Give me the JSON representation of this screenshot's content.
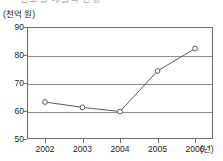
{
  "header": {
    "clipped_text": "연도별  매출액  현황",
    "clipped_note": "clipped"
  },
  "axes": {
    "y_unit_label": "(천억 원)",
    "x_unit_label": "(년)"
  },
  "chart_data": {
    "type": "line",
    "title": "",
    "xlabel": "(년)",
    "ylabel": "(천억 원)",
    "categories": [
      "2002",
      "2003",
      "2004",
      "2005",
      "2006"
    ],
    "values": [
      63.2,
      61.3,
      59.8,
      74.3,
      82.3
    ],
    "series": [
      {
        "name": "",
        "values": [
          63.2,
          61.3,
          59.8,
          74.3,
          82.3
        ]
      }
    ],
    "ylim": [
      50,
      90
    ],
    "yticks": [
      50,
      60,
      70,
      80,
      90
    ],
    "ytick_labels": [
      "50",
      "60",
      "70",
      "80",
      "90"
    ],
    "xtick_labels": [
      "2002",
      "2003",
      "2004",
      "2005",
      "2006"
    ],
    "grid": true,
    "grid_axis": "y",
    "legend": false,
    "legend_position": "none",
    "marker": "open-circle",
    "line_color": "#5a5a5a",
    "marker_color": "#5a5a5a",
    "grid_color": "#8d8d8d",
    "frame_color": "#6b6b6b"
  }
}
